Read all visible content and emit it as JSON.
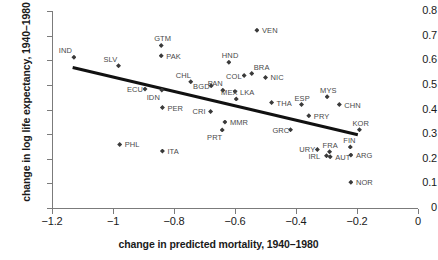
{
  "chart_data": {
    "type": "scatter",
    "title": "",
    "xlabel": "change in predicted mortality, 1940–1980",
    "ylabel": "change in log life expectancy, 1940–1980",
    "xlim": [
      -1.2,
      0
    ],
    "ylim": [
      0,
      0.8
    ],
    "xticks": [
      -1.2,
      -1,
      -0.8,
      -0.6,
      -0.4,
      -0.2,
      0
    ],
    "xticklabels": [
      "−1.2",
      "−1",
      "−0.8",
      "−0.6",
      "−0.4",
      "−0.2",
      "0"
    ],
    "yticks": [
      0,
      0.1,
      0.2,
      0.3,
      0.4,
      0.5,
      0.6,
      0.7,
      0.8
    ],
    "yticklabels": [
      "0",
      "0.1",
      "0.2",
      "0.3",
      "0.4",
      "0.5",
      "0.6",
      "0.7",
      "0.8"
    ],
    "grid": false,
    "legend": null,
    "marker": "diamond",
    "marker_color": "#3a3a3a",
    "trendline": {
      "x": [
        -1.13,
        -0.195
      ],
      "y": [
        0.578,
        0.305
      ],
      "color": "#111111",
      "width": 3
    },
    "points": [
      {
        "label": "IND",
        "x": -1.128,
        "y": 0.612,
        "lpos": "above-left"
      },
      {
        "label": "SLV",
        "x": -0.982,
        "y": 0.578,
        "lpos": "above-left"
      },
      {
        "label": "PHL",
        "x": -0.978,
        "y": 0.258,
        "lpos": "right"
      },
      {
        "label": "ECU",
        "x": -0.895,
        "y": 0.483,
        "lpos": "left"
      },
      {
        "label": "GTM",
        "x": -0.842,
        "y": 0.66,
        "lpos": "above"
      },
      {
        "label": "PAK",
        "x": -0.842,
        "y": 0.618,
        "lpos": "right"
      },
      {
        "label": "IDN",
        "x": -0.84,
        "y": 0.479,
        "lpos": "below-left"
      },
      {
        "label": "PER",
        "x": -0.838,
        "y": 0.408,
        "lpos": "right"
      },
      {
        "label": "ITA",
        "x": -0.838,
        "y": 0.231,
        "lpos": "right"
      },
      {
        "label": "CHL",
        "x": -0.745,
        "y": 0.513,
        "lpos": "above-left"
      },
      {
        "label": "BGD",
        "x": -0.678,
        "y": 0.496,
        "lpos": "left"
      },
      {
        "label": "CRI",
        "x": -0.68,
        "y": 0.392,
        "lpos": "left"
      },
      {
        "label": "HND",
        "x": -0.62,
        "y": 0.592,
        "lpos": "above"
      },
      {
        "label": "PAN",
        "x": -0.64,
        "y": 0.478,
        "lpos": "above-left"
      },
      {
        "label": "MMR",
        "x": -0.633,
        "y": 0.349,
        "lpos": "right"
      },
      {
        "label": "PRT",
        "x": -0.642,
        "y": 0.317,
        "lpos": "below-left"
      },
      {
        "label": "LKA",
        "x": -0.6,
        "y": 0.473,
        "lpos": "right"
      },
      {
        "label": "MEX",
        "x": -0.596,
        "y": 0.443,
        "lpos": "above-left"
      },
      {
        "label": "COL",
        "x": -0.57,
        "y": 0.538,
        "lpos": "left"
      },
      {
        "label": "VEN",
        "x": -0.528,
        "y": 0.722,
        "lpos": "right"
      },
      {
        "label": "BRA",
        "x": -0.545,
        "y": 0.546,
        "lpos": "above-right"
      },
      {
        "label": "NIC",
        "x": -0.5,
        "y": 0.53,
        "lpos": "right"
      },
      {
        "label": "THA",
        "x": -0.48,
        "y": 0.428,
        "lpos": "right"
      },
      {
        "label": "GRC",
        "x": -0.418,
        "y": 0.318,
        "lpos": "left"
      },
      {
        "label": "ESP",
        "x": -0.382,
        "y": 0.42,
        "lpos": "above"
      },
      {
        "label": "PRY",
        "x": -0.358,
        "y": 0.375,
        "lpos": "right"
      },
      {
        "label": "URY",
        "x": -0.33,
        "y": 0.238,
        "lpos": "left"
      },
      {
        "label": "MYS",
        "x": -0.298,
        "y": 0.452,
        "lpos": "above"
      },
      {
        "label": "FRA",
        "x": -0.29,
        "y": 0.228,
        "lpos": "above"
      },
      {
        "label": "IRL",
        "x": -0.3,
        "y": 0.212,
        "lpos": "left"
      },
      {
        "label": "AUT",
        "x": -0.288,
        "y": 0.208,
        "lpos": "right"
      },
      {
        "label": "CHN",
        "x": -0.258,
        "y": 0.42,
        "lpos": "right"
      },
      {
        "label": "FIN",
        "x": -0.222,
        "y": 0.248,
        "lpos": "above"
      },
      {
        "label": "ARG",
        "x": -0.22,
        "y": 0.215,
        "lpos": "right"
      },
      {
        "label": "KOR",
        "x": -0.192,
        "y": 0.318,
        "lpos": "above"
      },
      {
        "label": "NOR",
        "x": -0.22,
        "y": 0.105,
        "lpos": "right"
      }
    ]
  }
}
